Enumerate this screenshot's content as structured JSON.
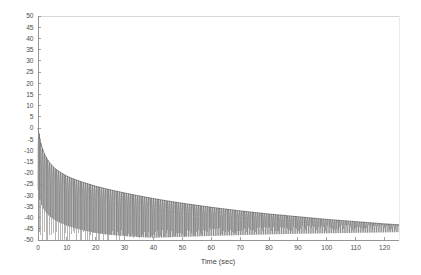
{
  "chart_data": {
    "type": "line",
    "title": "",
    "subtitle": "",
    "xlabel": "Time (sec)",
    "ylabel": "",
    "xlim": [
      0,
      125
    ],
    "ylim": [
      -50,
      50
    ],
    "grid": false,
    "legend": null,
    "legend_position": "none",
    "x_ticks": [
      0,
      10,
      20,
      30,
      40,
      50,
      60,
      70,
      80,
      90,
      100,
      110,
      120
    ],
    "x_tick_labels": [
      "0",
      "10",
      "20",
      "30",
      "40",
      "50",
      "60",
      "70",
      "80",
      "90",
      "100",
      "110",
      "120"
    ],
    "y_ticks": [
      50,
      45,
      40,
      35,
      30,
      25,
      20,
      15,
      10,
      5,
      0,
      -5,
      -10,
      -15,
      -20,
      -25,
      -30,
      -35,
      -40,
      -45,
      -50
    ],
    "y_tick_labels": [
      "50",
      "45",
      "40",
      "35",
      "30",
      "25",
      "20",
      "15",
      "10",
      "5",
      "0",
      "-5",
      "-10",
      "-15",
      "-20",
      "-25",
      "-30",
      "-35",
      "-40",
      "-45",
      "-50"
    ],
    "series": [
      {
        "name": "decaying oscillation",
        "color": "#6b6b6b",
        "description": "Dense oscillating waveform; upper envelope decays logarithmically from 0 toward -43, deep downward nulls toward -50",
        "envelope_upper": [
          {
            "x": 0.0,
            "y": 0.0
          },
          {
            "x": 0.5,
            "y": -4.0
          },
          {
            "x": 1.0,
            "y": -7.0
          },
          {
            "x": 1.5,
            "y": -9.0
          },
          {
            "x": 2.0,
            "y": -11.0
          },
          {
            "x": 3.0,
            "y": -13.5
          },
          {
            "x": 4.0,
            "y": -15.5
          },
          {
            "x": 5.0,
            "y": -17.0
          },
          {
            "x": 6.0,
            "y": -18.2
          },
          {
            "x": 8.0,
            "y": -20.0
          },
          {
            "x": 10.0,
            "y": -21.5
          },
          {
            "x": 12.0,
            "y": -22.6
          },
          {
            "x": 15.0,
            "y": -24.0
          },
          {
            "x": 18.0,
            "y": -25.2
          },
          {
            "x": 20.0,
            "y": -26.0
          },
          {
            "x": 25.0,
            "y": -27.6
          },
          {
            "x": 30.0,
            "y": -29.0
          },
          {
            "x": 35.0,
            "y": -30.3
          },
          {
            "x": 40.0,
            "y": -31.5
          },
          {
            "x": 45.0,
            "y": -32.6
          },
          {
            "x": 50.0,
            "y": -33.6
          },
          {
            "x": 55.0,
            "y": -34.5
          },
          {
            "x": 60.0,
            "y": -35.4
          },
          {
            "x": 65.0,
            "y": -36.2
          },
          {
            "x": 70.0,
            "y": -37.0
          },
          {
            "x": 75.0,
            "y": -37.7
          },
          {
            "x": 80.0,
            "y": -38.4
          },
          {
            "x": 85.0,
            "y": -39.0
          },
          {
            "x": 90.0,
            "y": -39.6
          },
          {
            "x": 95.0,
            "y": -40.2
          },
          {
            "x": 100.0,
            "y": -40.8
          },
          {
            "x": 105.0,
            "y": -41.3
          },
          {
            "x": 110.0,
            "y": -41.8
          },
          {
            "x": 115.0,
            "y": -42.3
          },
          {
            "x": 120.0,
            "y": -42.8
          },
          {
            "x": 125.0,
            "y": -43.2
          }
        ],
        "envelope_lower": [
          {
            "x": 0.0,
            "y": -50.0
          },
          {
            "x": 10.0,
            "y": -50.0
          },
          {
            "x": 20.0,
            "y": -50.0
          },
          {
            "x": 30.0,
            "y": -49.5
          },
          {
            "x": 40.0,
            "y": -49.0
          },
          {
            "x": 50.0,
            "y": -48.6
          },
          {
            "x": 60.0,
            "y": -48.2
          },
          {
            "x": 70.0,
            "y": -47.8
          },
          {
            "x": 80.0,
            "y": -47.5
          },
          {
            "x": 90.0,
            "y": -47.2
          },
          {
            "x": 100.0,
            "y": -47.0
          },
          {
            "x": 110.0,
            "y": -46.8
          },
          {
            "x": 120.0,
            "y": -46.6
          },
          {
            "x": 125.0,
            "y": -46.5
          }
        ],
        "oscillation_period_sec": 0.62,
        "ripple_count_approx": 200
      }
    ],
    "annotations": []
  },
  "axes": {
    "x_axis_label": "Time (sec)",
    "y_axis_label": ""
  },
  "style": {
    "background": "#ffffff",
    "plot_background": "#ffffff",
    "axis_color": "#8a8a8a",
    "tick_label_color": "#4a4a4a",
    "trace_color": "#6b6b6b"
  }
}
